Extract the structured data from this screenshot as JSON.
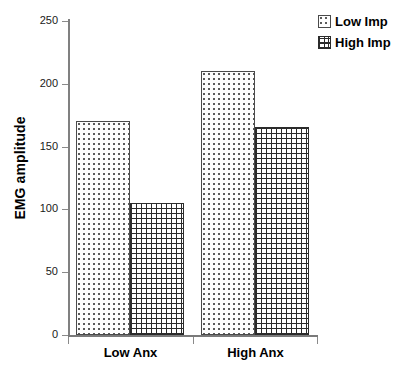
{
  "chart_data": {
    "type": "bar",
    "title": "",
    "subtitle": "",
    "xlabel": "",
    "ylabel": "EMG amplitude",
    "categories": [
      "Low Anx",
      "High Anx"
    ],
    "series": [
      {
        "name": "Low Imp",
        "pattern": "dots",
        "values": [
          170,
          210
        ]
      },
      {
        "name": "High Imp",
        "pattern": "grid",
        "values": [
          105,
          166
        ]
      }
    ],
    "ylim": [
      0,
      250
    ],
    "yticks": [
      0,
      50,
      100,
      150,
      200,
      250
    ],
    "ytick_labels": [
      "0",
      "50",
      "100",
      "150",
      "200",
      "250"
    ],
    "grid": false,
    "legend_position": "top-right",
    "colors": {
      "axis": "#808080",
      "bar_outline": "#4a4a4a",
      "grid_pattern": "#2b2b2b",
      "text": "#000000"
    }
  },
  "legend": {
    "items": [
      {
        "label": "Low Imp",
        "pattern": "dots"
      },
      {
        "label": "High Imp",
        "pattern": "grid"
      }
    ]
  },
  "axes": {
    "y_title": "EMG amplitude",
    "y_tick_labels": [
      "250",
      "200",
      "150",
      "100",
      "50",
      "0"
    ],
    "x_tick_labels": [
      "Low Anx",
      "High Anx"
    ]
  },
  "caption": {
    "text": ""
  }
}
